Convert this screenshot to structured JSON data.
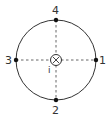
{
  "diagram": {
    "type": "circle-with-points",
    "colors": {
      "stroke": "#333333",
      "dashed": "#555555",
      "background": "#ffffff"
    },
    "center_symbol": {
      "glyph": "circle-with-x",
      "meaning": "current into page",
      "label": "i"
    },
    "points": [
      {
        "label": "1",
        "position": "right"
      },
      {
        "label": "2",
        "position": "bottom"
      },
      {
        "label": "3",
        "position": "left"
      },
      {
        "label": "4",
        "position": "top"
      }
    ]
  }
}
